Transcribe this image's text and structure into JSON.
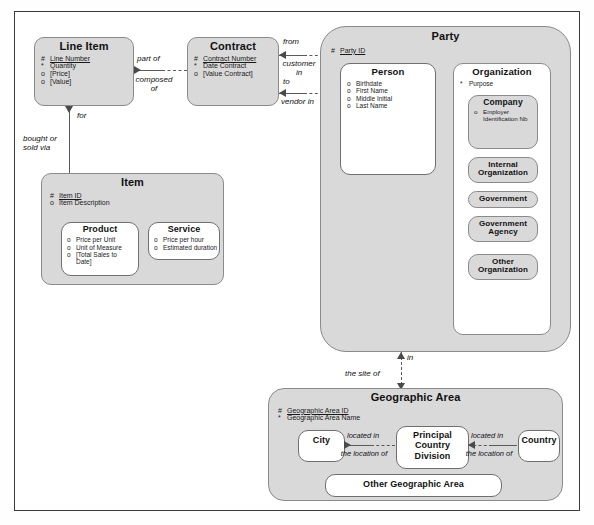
{
  "diagram": {
    "kind": "entity-relationship-diagram",
    "notation": "Oracle Barker",
    "legend": {
      "uid_marker": "#",
      "mandatory_marker": "*",
      "optional_marker": "o"
    }
  },
  "entities": {
    "line_item": {
      "title": "Line Item",
      "attributes": [
        {
          "marker": "#",
          "text": "Line Number"
        },
        {
          "marker": "*",
          "text": "Quantity"
        },
        {
          "marker": "o",
          "text": "[Price]"
        },
        {
          "marker": "o",
          "text": "[Value]"
        }
      ]
    },
    "contract": {
      "title": "Contract",
      "attributes": [
        {
          "marker": "#",
          "text": "Contract Number"
        },
        {
          "marker": "*",
          "text": "Date Contract"
        },
        {
          "marker": "o",
          "text": "[Value Contract]"
        }
      ]
    },
    "item": {
      "title": "Item",
      "attributes": [
        {
          "marker": "#",
          "text": "Item ID"
        },
        {
          "marker": "o",
          "text": "Item Description"
        }
      ]
    },
    "product": {
      "title": "Product",
      "attributes": [
        {
          "marker": "o",
          "text": "Price per Unit"
        },
        {
          "marker": "o",
          "text": "Unit of Measure"
        },
        {
          "marker": "o",
          "text": "[Total Sales to Date]"
        }
      ]
    },
    "service": {
      "title": "Service",
      "attributes": [
        {
          "marker": "o",
          "text": "Price per hour"
        },
        {
          "marker": "o",
          "text": "Estimated duration"
        }
      ]
    },
    "party": {
      "title": "Party",
      "attributes": [
        {
          "marker": "#",
          "text": "Party ID"
        }
      ]
    },
    "person": {
      "title": "Person",
      "attributes": [
        {
          "marker": "o",
          "text": "Birthdate"
        },
        {
          "marker": "o",
          "text": "First Name"
        },
        {
          "marker": "o",
          "text": "Middle Initial"
        },
        {
          "marker": "o",
          "text": "Last Name"
        }
      ]
    },
    "organization": {
      "title": "Organization",
      "attributes": [
        {
          "marker": "*",
          "text": "Purpose"
        }
      ]
    },
    "company": {
      "title": "Company",
      "attributes": [
        {
          "marker": "o",
          "text": "Employer Identification Nb"
        }
      ]
    },
    "internal_organization": {
      "title": "Internal Organization",
      "attributes": []
    },
    "government": {
      "title": "Government",
      "attributes": []
    },
    "government_agency": {
      "title": "Government Agency",
      "attributes": []
    },
    "other_organization": {
      "title": "Other Organization",
      "attributes": []
    },
    "geographic_area": {
      "title": "Geographic Area",
      "attributes": [
        {
          "marker": "#",
          "text": "Geographic Area ID"
        },
        {
          "marker": "*",
          "text": "Geographic Area Name"
        }
      ]
    },
    "city": {
      "title": "City",
      "attributes": []
    },
    "principal_country_division": {
      "title": "Principal Country Division",
      "attributes": []
    },
    "country": {
      "title": "Country",
      "attributes": []
    },
    "other_geographic_area": {
      "title": "Other Geographic Area",
      "attributes": []
    }
  },
  "relationships": {
    "part_of": "part of",
    "composed_of": "composed of",
    "for": "for",
    "bought_or_sold_via": "bought or sold via",
    "from": "from",
    "to": "to",
    "customer_in": "customer in",
    "vendor_in": "vendor in",
    "in": "in",
    "the_site_of": "the site of",
    "located_in_city": "located in",
    "the_location_of_city": "the location of",
    "located_in_country": "located in",
    "the_location_of_country": "the location of"
  },
  "colors": {
    "supertype_fill": "#d9d9d9",
    "subtype_fill": "#ffffff",
    "border": "#8a8a8a",
    "line": "#5a5a5a",
    "frame": "#3a3a3a",
    "text": "#111111"
  }
}
